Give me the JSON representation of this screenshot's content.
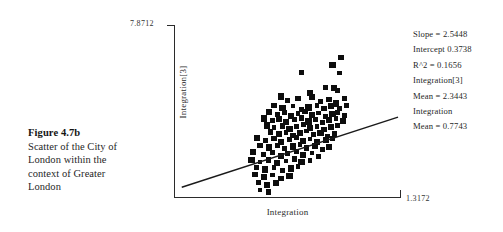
{
  "caption": {
    "title": "Figure 4.7b",
    "body": "Scatter of the City of London within the context of Greater London"
  },
  "chart_data": {
    "type": "scatter",
    "title": "",
    "xlabel": "Integration",
    "ylabel": "Integration[3]",
    "ymax_tick": "7.8712",
    "xmax_tick": "1.3172",
    "grid": false,
    "legend": "none",
    "xlim": [
      0.0,
      1.3172
    ],
    "ylim": [
      0.0,
      7.8712
    ],
    "marker": "square",
    "marker_color": "#0d0d0d",
    "trendline": {
      "slope": 2.5448,
      "intercept": 0.3738,
      "x_start": 0.045,
      "x_end": 1.3,
      "color": "#1a1a1a"
    },
    "points": [
      [
        0.74,
        5.7
      ],
      [
        0.97,
        6.38
      ],
      [
        0.92,
        6.05
      ],
      [
        0.96,
        5.68
      ],
      [
        0.88,
        5.02
      ],
      [
        0.93,
        5.0
      ],
      [
        0.95,
        4.88
      ],
      [
        0.79,
        4.78
      ],
      [
        0.62,
        4.62
      ],
      [
        0.66,
        4.44
      ],
      [
        0.72,
        4.52
      ],
      [
        0.8,
        4.6
      ],
      [
        0.85,
        4.4
      ],
      [
        0.9,
        4.48
      ],
      [
        0.94,
        4.3
      ],
      [
        0.99,
        4.52
      ],
      [
        0.58,
        4.22
      ],
      [
        0.63,
        4.1
      ],
      [
        0.69,
        4.18
      ],
      [
        0.74,
        4.02
      ],
      [
        0.78,
        4.12
      ],
      [
        0.83,
        4.22
      ],
      [
        0.87,
        4.06
      ],
      [
        0.91,
        4.18
      ],
      [
        0.96,
        4.08
      ],
      [
        1.0,
        4.22
      ],
      [
        0.55,
        3.92
      ],
      [
        0.6,
        3.8
      ],
      [
        0.64,
        3.88
      ],
      [
        0.68,
        3.74
      ],
      [
        0.72,
        3.84
      ],
      [
        0.76,
        3.94
      ],
      [
        0.8,
        3.78
      ],
      [
        0.84,
        3.86
      ],
      [
        0.88,
        3.72
      ],
      [
        0.92,
        3.82
      ],
      [
        0.95,
        3.9
      ],
      [
        0.99,
        3.76
      ],
      [
        0.52,
        3.62
      ],
      [
        0.57,
        3.52
      ],
      [
        0.61,
        3.6
      ],
      [
        0.65,
        3.46
      ],
      [
        0.7,
        3.56
      ],
      [
        0.74,
        3.64
      ],
      [
        0.78,
        3.48
      ],
      [
        0.82,
        3.58
      ],
      [
        0.86,
        3.44
      ],
      [
        0.9,
        3.54
      ],
      [
        0.94,
        3.62
      ],
      [
        0.98,
        3.5
      ],
      [
        0.54,
        3.3
      ],
      [
        0.58,
        3.2
      ],
      [
        0.63,
        3.28
      ],
      [
        0.67,
        3.14
      ],
      [
        0.71,
        3.24
      ],
      [
        0.75,
        3.34
      ],
      [
        0.79,
        3.18
      ],
      [
        0.83,
        3.26
      ],
      [
        0.87,
        3.12
      ],
      [
        0.91,
        3.22
      ],
      [
        0.95,
        3.3
      ],
      [
        0.56,
        3.0
      ],
      [
        0.61,
        2.9
      ],
      [
        0.65,
        2.98
      ],
      [
        0.69,
        2.84
      ],
      [
        0.73,
        2.94
      ],
      [
        0.77,
        3.04
      ],
      [
        0.81,
        2.88
      ],
      [
        0.85,
        2.96
      ],
      [
        0.89,
        2.82
      ],
      [
        0.93,
        2.92
      ],
      [
        0.48,
        2.72
      ],
      [
        0.53,
        2.62
      ],
      [
        0.58,
        2.7
      ],
      [
        0.62,
        2.56
      ],
      [
        0.67,
        2.66
      ],
      [
        0.71,
        2.76
      ],
      [
        0.75,
        2.6
      ],
      [
        0.79,
        2.68
      ],
      [
        0.83,
        2.54
      ],
      [
        0.88,
        2.64
      ],
      [
        0.92,
        2.72
      ],
      [
        0.5,
        2.4
      ],
      [
        0.55,
        2.3
      ],
      [
        0.6,
        2.38
      ],
      [
        0.64,
        2.24
      ],
      [
        0.69,
        2.34
      ],
      [
        0.73,
        2.44
      ],
      [
        0.77,
        2.28
      ],
      [
        0.82,
        2.36
      ],
      [
        0.86,
        2.22
      ],
      [
        0.9,
        2.32
      ],
      [
        0.46,
        2.08
      ],
      [
        0.52,
        1.98
      ],
      [
        0.57,
        2.06
      ],
      [
        0.62,
        1.92
      ],
      [
        0.66,
        2.02
      ],
      [
        0.71,
        2.12
      ],
      [
        0.75,
        1.96
      ],
      [
        0.8,
        2.04
      ],
      [
        0.84,
        1.9
      ],
      [
        0.45,
        1.74
      ],
      [
        0.5,
        1.64
      ],
      [
        0.55,
        1.72
      ],
      [
        0.6,
        1.58
      ],
      [
        0.65,
        1.68
      ],
      [
        0.7,
        1.78
      ],
      [
        0.74,
        1.62
      ],
      [
        0.79,
        1.7
      ],
      [
        0.48,
        1.4
      ],
      [
        0.53,
        1.3
      ],
      [
        0.58,
        1.38
      ],
      [
        0.63,
        1.24
      ],
      [
        0.68,
        1.34
      ],
      [
        0.72,
        1.44
      ],
      [
        0.47,
        1.06
      ],
      [
        0.52,
        0.96
      ],
      [
        0.57,
        1.04
      ],
      [
        0.62,
        0.9
      ],
      [
        0.67,
        1.0
      ],
      [
        0.49,
        0.7
      ],
      [
        0.54,
        0.6
      ],
      [
        0.59,
        0.68
      ],
      [
        0.5,
        0.36
      ],
      [
        0.55,
        0.28
      ]
    ]
  },
  "stats": {
    "lines": [
      "Slope = 2.5448",
      "Intercept 0.3738",
      "R^2 = 0.1656",
      "Integration[3]",
      "Mean = 2.3443",
      "Integration",
      "Mean = 0.7743"
    ]
  }
}
